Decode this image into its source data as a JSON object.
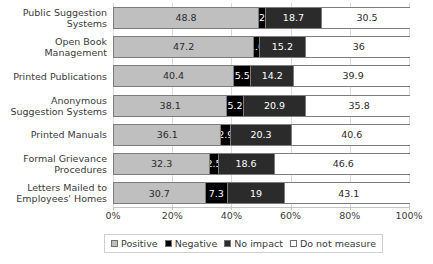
{
  "chart_data": {
    "type": "bar",
    "orientation": "horizontal",
    "stacked": true,
    "stack_mode": "percent",
    "title": "",
    "subtitle": "",
    "xlabel": "",
    "ylabel": "",
    "xlim": [
      0,
      100
    ],
    "grid": true,
    "grid_axis": "x",
    "legend_position": "bottom",
    "xticks": [
      "0%",
      "20%",
      "40%",
      "60%",
      "80%",
      "100%"
    ],
    "xtick_values": [
      0,
      20,
      40,
      60,
      80,
      100
    ],
    "categories": [
      "Public Suggestion Systems",
      "Open Book Management",
      "Printed Publications",
      "Anonymous Suggestion Systems",
      "Printed Manuals",
      "Formal Grievance Procedures",
      "Letters Mailed to Employees' Homes"
    ],
    "category_lines": [
      [
        "Public Suggestion",
        "Systems"
      ],
      [
        "Open Book",
        "Management"
      ],
      [
        "Printed Publications"
      ],
      [
        "Anonymous",
        "Suggestion Systems"
      ],
      [
        "Printed Manuals"
      ],
      [
        "Formal Grievance",
        "Procedures"
      ],
      [
        "Letters Mailed to",
        "Employees' Homes"
      ]
    ],
    "series": [
      {
        "name": "Positive",
        "color": "#bfbfbf",
        "values": [
          48.8,
          47.2,
          40.4,
          38.1,
          36.1,
          32.3,
          30.7
        ],
        "labels": [
          "48.8",
          "47.2",
          "40.4",
          "38.1",
          "36.1",
          "32.3",
          "30.7"
        ]
      },
      {
        "name": "Negative",
        "color": "#000000",
        "values": [
          2,
          1.6,
          5.5,
          5.2,
          2.9,
          2.5,
          7.3
        ],
        "labels": [
          "2",
          "1.6",
          "5.5",
          "5.2",
          "2.9",
          "2.5",
          "7.3"
        ]
      },
      {
        "name": "No impact",
        "color": "#2b2b2b",
        "values": [
          18.7,
          15.2,
          14.2,
          20.9,
          20.3,
          18.6,
          19
        ],
        "labels": [
          "18.7",
          "15.2",
          "14.2",
          "20.9",
          "20.3",
          "18.6",
          "19"
        ]
      },
      {
        "name": "Do not measure",
        "color": "#ffffff",
        "values": [
          30.5,
          36,
          39.9,
          35.8,
          40.6,
          46.6,
          43.1
        ],
        "labels": [
          "30.5",
          "36",
          "39.9",
          "35.8",
          "40.6",
          "46.6",
          "43.1"
        ]
      }
    ]
  },
  "legend": {
    "items": [
      {
        "label": "Positive",
        "swatch": "#bfbfbf"
      },
      {
        "label": "Negative",
        "swatch": "#000000"
      },
      {
        "label": "No impact",
        "swatch": "#2b2b2b"
      },
      {
        "label": "Do not measure",
        "swatch": "#ffffff"
      }
    ]
  }
}
